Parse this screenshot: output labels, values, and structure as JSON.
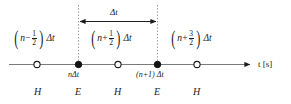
{
  "figure": {
    "name": "time-axis-leapfrog-diagram",
    "axis_label": "t [s]",
    "axis_variable": "t",
    "axis_unit": "[s]",
    "interval_label": "Δt",
    "colors": {
      "line": "#7a7a7a",
      "text": "#1c1c1c",
      "marker_fill": "#111111",
      "marker_open": "#ffffff",
      "dotted": "#9a9a9a"
    },
    "top_labels": [
      {
        "id": "label-n-minus-half",
        "open_paren": "(",
        "var": "n",
        "operator": "−",
        "numerator": "1",
        "denominator": "2",
        "close_paren": ")",
        "suffix": "Δt"
      },
      {
        "id": "label-n-plus-half",
        "open_paren": "(",
        "var": "n",
        "operator": "+",
        "numerator": "1",
        "denominator": "2",
        "close_paren": ")",
        "suffix": "Δt"
      },
      {
        "id": "label-n-plus-three-halves",
        "open_paren": "(",
        "var": "n",
        "operator": "+",
        "numerator": "3",
        "denominator": "2",
        "close_paren": ")",
        "suffix": "Δt"
      }
    ],
    "tick_labels": [
      {
        "id": "tick-n-dt",
        "text": "nΔt"
      },
      {
        "id": "tick-n-plus-1-dt",
        "text": "(n+1) Δt"
      }
    ],
    "field_row": [
      {
        "id": "field-h-1",
        "text": "H"
      },
      {
        "id": "field-e-1",
        "text": "E"
      },
      {
        "id": "field-h-2",
        "text": "H"
      },
      {
        "id": "field-e-2",
        "text": "E"
      },
      {
        "id": "field-h-3",
        "text": "H"
      }
    ],
    "markers": [
      {
        "id": "marker-open-1",
        "type": "open",
        "x": 37
      },
      {
        "id": "marker-filled-1",
        "type": "filled",
        "x": 78
      },
      {
        "id": "marker-open-2",
        "type": "open",
        "x": 118
      },
      {
        "id": "marker-filled-2",
        "type": "filled",
        "x": 157
      },
      {
        "id": "marker-open-3",
        "type": "open",
        "x": 197
      }
    ]
  }
}
